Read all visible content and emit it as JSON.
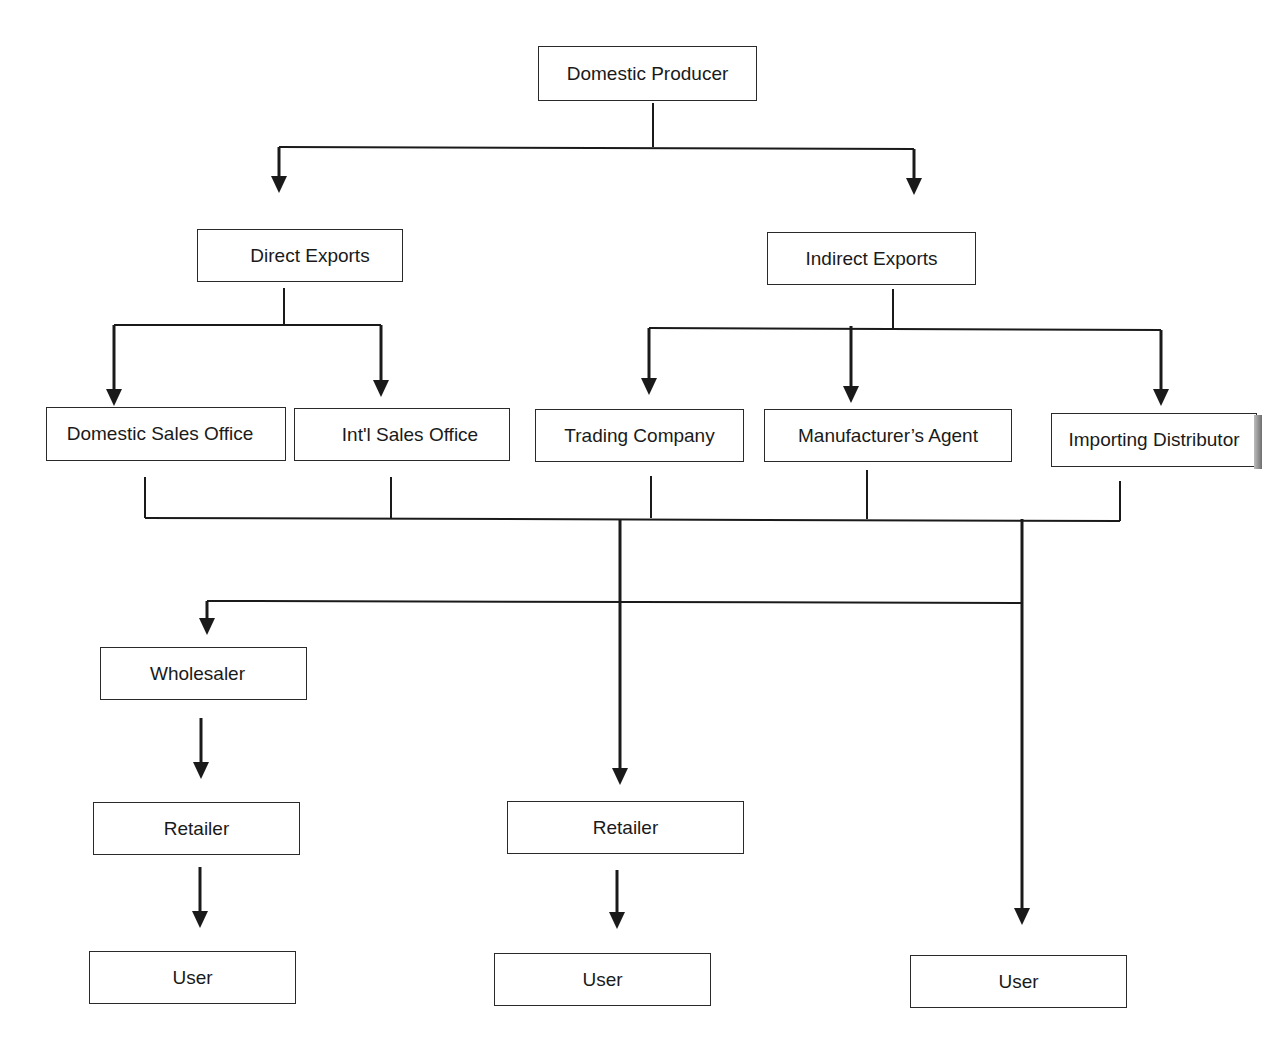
{
  "diagram": {
    "title": "",
    "type": "flowchart",
    "line_color": "#1a1a1a",
    "background": "#ffffff",
    "nodes": [
      {
        "id": "domestic_producer",
        "label": "Domestic  Producer",
        "x": 538,
        "y": 46,
        "w": 219,
        "h": 55,
        "text_offset_x": 0
      },
      {
        "id": "direct_exports",
        "label": "Direct Exports",
        "x": 197,
        "y": 229,
        "w": 206,
        "h": 53,
        "text_offset_x": 10
      },
      {
        "id": "indirect_exports",
        "label": "Indirect Exports",
        "x": 767,
        "y": 232,
        "w": 209,
        "h": 53,
        "text_offset_x": 0
      },
      {
        "id": "domestic_sales_office",
        "label": "Domestic Sales Office",
        "x": 46,
        "y": 407,
        "w": 240,
        "h": 54,
        "text_offset_x": -6
      },
      {
        "id": "intl_sales_office",
        "label": "Int'l Sales Office",
        "x": 294,
        "y": 408,
        "w": 216,
        "h": 53,
        "text_offset_x": 8
      },
      {
        "id": "trading_company",
        "label": "Trading Company",
        "x": 535,
        "y": 409,
        "w": 209,
        "h": 53,
        "text_offset_x": 0
      },
      {
        "id": "manufacturers_agent",
        "label": "Manufacturer’s Agent",
        "x": 764,
        "y": 409,
        "w": 248,
        "h": 53,
        "text_offset_x": 0
      },
      {
        "id": "importing_distributor",
        "label": "Importing  Distributor",
        "x": 1051,
        "y": 413,
        "w": 206,
        "h": 54,
        "text_offset_x": 0
      },
      {
        "id": "wholesaler",
        "label": "Wholesaler",
        "x": 100,
        "y": 647,
        "w": 207,
        "h": 53,
        "text_offset_x": -6
      },
      {
        "id": "retailer_left",
        "label": "Retailer",
        "x": 93,
        "y": 802,
        "w": 207,
        "h": 53,
        "text_offset_x": 0
      },
      {
        "id": "user_left",
        "label": "User",
        "x": 89,
        "y": 951,
        "w": 207,
        "h": 53,
        "text_offset_x": 0
      },
      {
        "id": "retailer_mid",
        "label": "Retailer",
        "x": 507,
        "y": 801,
        "w": 237,
        "h": 53,
        "text_offset_x": 0
      },
      {
        "id": "user_mid",
        "label": "User",
        "x": 494,
        "y": 953,
        "w": 217,
        "h": 53,
        "text_offset_x": 0
      },
      {
        "id": "user_right",
        "label": "User",
        "x": 910,
        "y": 955,
        "w": 217,
        "h": 53,
        "text_offset_x": 0
      }
    ],
    "lines": [
      {
        "points": [
          [
            653,
            103
          ],
          [
            653,
            147
          ]
        ]
      },
      {
        "points": [
          [
            279,
            147
          ],
          [
            914,
            149
          ]
        ]
      },
      {
        "points": [
          [
            284,
            288
          ],
          [
            284,
            326
          ]
        ]
      },
      {
        "points": [
          [
            114,
            325
          ],
          [
            381,
            325
          ]
        ]
      },
      {
        "points": [
          [
            893,
            289
          ],
          [
            893,
            328
          ]
        ]
      },
      {
        "points": [
          [
            649,
            328
          ],
          [
            1161,
            330
          ]
        ]
      },
      {
        "points": [
          [
            145,
            477
          ],
          [
            145,
            518
          ]
        ]
      },
      {
        "points": [
          [
            391,
            477
          ],
          [
            391,
            518
          ]
        ]
      },
      {
        "points": [
          [
            651,
            476
          ],
          [
            651,
            518
          ]
        ]
      },
      {
        "points": [
          [
            867,
            470
          ],
          [
            867,
            519
          ]
        ]
      },
      {
        "points": [
          [
            1120,
            481
          ],
          [
            1120,
            521
          ]
        ]
      },
      {
        "points": [
          [
            145,
            518
          ],
          [
            1120,
            521
          ]
        ]
      },
      {
        "points": [
          [
            207,
            601
          ],
          [
            1022,
            603
          ]
        ]
      }
    ],
    "arrows": [
      {
        "points": [
          [
            279,
            147
          ],
          [
            279,
            193
          ]
        ]
      },
      {
        "points": [
          [
            914,
            149
          ],
          [
            914,
            195
          ]
        ]
      },
      {
        "points": [
          [
            114,
            325
          ],
          [
            114,
            406
          ]
        ]
      },
      {
        "points": [
          [
            381,
            325
          ],
          [
            381,
            397
          ]
        ]
      },
      {
        "points": [
          [
            649,
            328
          ],
          [
            649,
            395
          ]
        ]
      },
      {
        "points": [
          [
            851,
            326
          ],
          [
            851,
            403
          ]
        ]
      },
      {
        "points": [
          [
            1161,
            330
          ],
          [
            1161,
            406
          ]
        ]
      },
      {
        "points": [
          [
            620,
            519
          ],
          [
            620,
            785
          ]
        ]
      },
      {
        "points": [
          [
            1022,
            519
          ],
          [
            1022,
            925
          ]
        ]
      },
      {
        "points": [
          [
            207,
            601
          ],
          [
            207,
            635
          ]
        ]
      },
      {
        "points": [
          [
            201,
            718
          ],
          [
            201,
            779
          ]
        ]
      },
      {
        "points": [
          [
            200,
            867
          ],
          [
            200,
            928
          ]
        ]
      },
      {
        "points": [
          [
            617,
            870
          ],
          [
            617,
            929
          ]
        ]
      }
    ]
  }
}
